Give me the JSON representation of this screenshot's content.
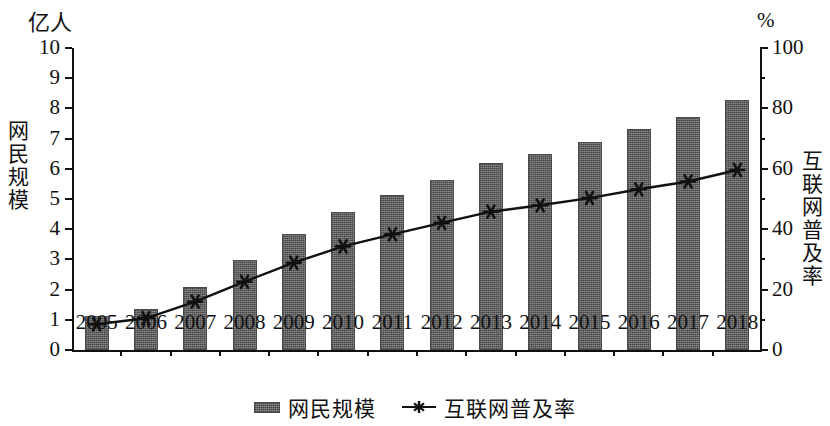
{
  "chart_data": {
    "type": "bar",
    "title": "",
    "categories": [
      "2005",
      "2006",
      "2007",
      "2008",
      "2009",
      "2010",
      "2011",
      "2012",
      "2013",
      "2014",
      "2015",
      "2016",
      "2017",
      "2018"
    ],
    "series": [
      {
        "name": "网民规模",
        "kind": "bar",
        "axis": "left",
        "unit": "亿人",
        "values": [
          1.11,
          1.37,
          2.1,
          2.98,
          3.84,
          4.57,
          5.13,
          5.64,
          6.18,
          6.49,
          6.88,
          7.31,
          7.72,
          8.29
        ]
      },
      {
        "name": "互联网普及率",
        "kind": "line",
        "axis": "right",
        "unit": "%",
        "marker": "asterisk",
        "values": [
          8.5,
          10.5,
          16.0,
          22.6,
          28.9,
          34.3,
          38.3,
          42.1,
          45.8,
          47.9,
          50.3,
          53.2,
          55.8,
          59.6
        ]
      }
    ],
    "left_axis": {
      "unit_label": "亿人",
      "title": "网民规模",
      "ticks": [
        0,
        1,
        2,
        3,
        4,
        5,
        6,
        7,
        8,
        9,
        10
      ],
      "ylim": [
        0,
        10
      ]
    },
    "right_axis": {
      "unit_label": "%",
      "title": "互联网普及率",
      "ticks": [
        0,
        20,
        40,
        60,
        80,
        100
      ],
      "minor_ticks": [
        10,
        30,
        50,
        70,
        90
      ],
      "ylim": [
        0,
        100
      ]
    },
    "xlabel": "",
    "grid": false,
    "legend": {
      "position": "bottom-center",
      "entries": [
        {
          "label": "网民规模",
          "marker": "bar-swatch"
        },
        {
          "label": "互联网普及率",
          "marker": "line-asterisk"
        }
      ]
    },
    "colors": {
      "bar_fill": "#6f6f6f",
      "bar_edge": "#4a4a4a",
      "line": "#111111",
      "axis": "#111111",
      "background": "#ffffff"
    }
  }
}
